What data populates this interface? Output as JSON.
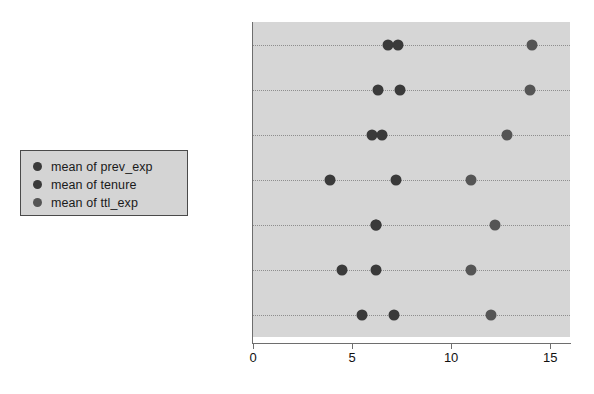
{
  "legend": {
    "position": "left-middle",
    "entries": [
      {
        "label": "mean of prev_exp",
        "color": "#3a3a3a"
      },
      {
        "label": "mean of tenure",
        "color": "#3a3a3a"
      },
      {
        "label": "mean of ttl_exp",
        "color": "#555555"
      }
    ]
  },
  "chart_data": {
    "type": "scatter",
    "title": "",
    "xlabel": "",
    "ylabel": "",
    "orientation": "horizontal",
    "grid": true,
    "plot_background": "#d6d6d6",
    "marker_color": "#3a3a3a",
    "xlim": [
      0,
      16
    ],
    "xticks": [
      0,
      5,
      10,
      15
    ],
    "xtick_labels": [
      "0",
      "5",
      "10",
      "15"
    ],
    "categories": [
      "Prof",
      "Mgmt",
      "Sales",
      "Cler.",
      "Operat.",
      "Labor",
      "Other"
    ],
    "series": [
      {
        "name": "mean of prev_exp",
        "color": "#3a3a3a",
        "values": [
          6.8,
          6.3,
          6.0,
          3.9,
          6.2,
          4.5,
          5.5
        ]
      },
      {
        "name": "mean of tenure",
        "color": "#3a3a3a",
        "values": [
          7.3,
          7.4,
          6.5,
          7.2,
          6.2,
          6.2,
          7.1
        ]
      },
      {
        "name": "mean of ttl_exp",
        "color": "#555555",
        "values": [
          14.1,
          14.0,
          12.8,
          11.0,
          12.2,
          11.0,
          12.0
        ]
      }
    ]
  }
}
